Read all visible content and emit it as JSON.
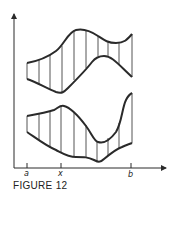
{
  "figure": {
    "caption": "FIGURE 12",
    "tick_labels": {
      "a": "a",
      "x": "x",
      "b": "b"
    },
    "colors": {
      "stroke": "#2a2a2a",
      "background": "#ffffff"
    }
  }
}
